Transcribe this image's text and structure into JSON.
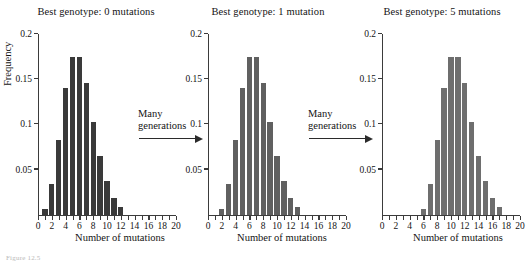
{
  "figure": {
    "caption": "Figure 12.5",
    "xlabel": "Number of mutations",
    "ylabel": "Frequency"
  },
  "transitions": [
    {
      "line1": "Many",
      "line2": "generations"
    },
    {
      "line1": "Many",
      "line2": "generations"
    }
  ],
  "panels": [
    {
      "title": "Best genotype: 0 mutations",
      "color": "#3a3a3a"
    },
    {
      "title": "Best genotype: 1 mutation",
      "color": "#606060"
    },
    {
      "title": "Best genotype: 5 mutations",
      "color": "#6e6e6e"
    }
  ],
  "chart_data": [
    {
      "type": "bar",
      "title": "Best genotype: 0 mutations",
      "xlabel": "Number of mutations",
      "ylabel": "Frequency",
      "xlim": [
        0,
        20
      ],
      "ylim": [
        0,
        0.2
      ],
      "yticks": [
        0.05,
        0.1,
        0.15,
        0.2
      ],
      "ytick_labels": [
        "0.05",
        "0.1",
        "0.15",
        "0.2"
      ],
      "xticks": [
        0,
        2,
        4,
        6,
        8,
        10,
        12,
        14,
        16,
        18,
        20
      ],
      "xtick_labels": [
        "0",
        "2",
        "4",
        "6",
        "8",
        "10",
        "12",
        "14",
        "16",
        "18",
        "20"
      ],
      "grid": false,
      "legend": "none",
      "bar_color": "#3a3a3a",
      "categories": [
        1,
        2,
        3,
        4,
        5,
        6,
        7,
        8,
        9,
        10,
        11,
        12
      ],
      "values": [
        0.006,
        0.034,
        0.083,
        0.14,
        0.175,
        0.175,
        0.146,
        0.103,
        0.065,
        0.037,
        0.019,
        0.008
      ]
    },
    {
      "type": "bar",
      "title": "Best genotype: 1 mutation",
      "xlabel": "Number of mutations",
      "ylabel": "Frequency",
      "xlim": [
        0,
        20
      ],
      "ylim": [
        0,
        0.2
      ],
      "yticks": [
        0.05,
        0.1,
        0.15,
        0.2
      ],
      "ytick_labels": [
        "0.05",
        "0.1",
        "0.15",
        "0.2"
      ],
      "xticks": [
        0,
        2,
        4,
        6,
        8,
        10,
        12,
        14,
        16,
        18,
        20
      ],
      "xtick_labels": [
        "0",
        "2",
        "4",
        "6",
        "8",
        "10",
        "12",
        "14",
        "16",
        "18",
        "20"
      ],
      "grid": false,
      "legend": "none",
      "bar_color": "#606060",
      "categories": [
        2,
        3,
        4,
        5,
        6,
        7,
        8,
        9,
        10,
        11,
        12,
        13
      ],
      "values": [
        0.006,
        0.034,
        0.083,
        0.14,
        0.175,
        0.175,
        0.146,
        0.103,
        0.065,
        0.037,
        0.019,
        0.008
      ]
    },
    {
      "type": "bar",
      "title": "Best genotype: 5 mutations",
      "xlabel": "Number of mutations",
      "ylabel": "Frequency",
      "xlim": [
        0,
        20
      ],
      "ylim": [
        0,
        0.2
      ],
      "yticks": [
        0.05,
        0.1,
        0.15,
        0.2
      ],
      "ytick_labels": [
        "0.05",
        "0.1",
        "0.15",
        "0.2"
      ],
      "xticks": [
        0,
        2,
        4,
        6,
        8,
        10,
        12,
        14,
        16,
        18,
        20
      ],
      "xtick_labels": [
        "0",
        "2",
        "4",
        "6",
        "8",
        "10",
        "12",
        "14",
        "16",
        "18",
        "20"
      ],
      "grid": false,
      "legend": "none",
      "bar_color": "#6e6e6e",
      "categories": [
        6,
        7,
        8,
        9,
        10,
        11,
        12,
        13,
        14,
        15,
        16,
        17
      ],
      "values": [
        0.006,
        0.034,
        0.083,
        0.14,
        0.175,
        0.175,
        0.146,
        0.103,
        0.065,
        0.037,
        0.019,
        0.008
      ]
    }
  ]
}
